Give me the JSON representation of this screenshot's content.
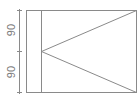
{
  "diagram": {
    "type": "technical-drawing",
    "frame": {
      "x": 26,
      "y": 10,
      "width": 110,
      "height": 82
    },
    "inner_vertical_line_x": 41,
    "triangle": {
      "apex": [
        41,
        51
      ],
      "top_right": [
        136,
        10
      ],
      "bottom_right": [
        136,
        92
      ]
    },
    "dimension": {
      "line_x": 19,
      "ticks_y": [
        10,
        51,
        92
      ],
      "labels": [
        {
          "text": "90",
          "x": 11,
          "y": 30
        },
        {
          "text": "90",
          "x": 11,
          "y": 72
        }
      ]
    },
    "colors": {
      "stroke": "#8a8a8a",
      "text": "#7a7a7a",
      "background": "#ffffff"
    }
  }
}
